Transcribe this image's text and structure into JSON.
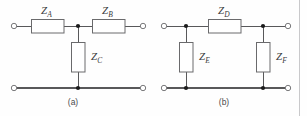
{
  "figure": {
    "colors": {
      "wire": "#58585a",
      "component_stroke": "#6a6a6c",
      "component_fill": "#ffffff",
      "node_dot": "#1b1b1b",
      "terminal": "#7a7a7c",
      "label_text": "#3a3a3c",
      "caption_text": "#4a4a4c",
      "page_rule": "#c9c9cb",
      "background": "#fefefe"
    },
    "circuits": [
      {
        "id": "circuit-a",
        "caption": "(a)",
        "topology": "T-network",
        "components": [
          {
            "id": "ZA",
            "symbol": "Z",
            "subscript": "A",
            "orientation": "horizontal",
            "position": "top-left-series"
          },
          {
            "id": "ZB",
            "symbol": "Z",
            "subscript": "B",
            "orientation": "horizontal",
            "position": "top-right-series"
          },
          {
            "id": "ZC",
            "symbol": "Z",
            "subscript": "C",
            "orientation": "vertical",
            "position": "center-shunt"
          }
        ],
        "terminals": [
          {
            "id": "a-in-top",
            "side": "left",
            "rail": "top"
          },
          {
            "id": "a-in-bottom",
            "side": "left",
            "rail": "bottom"
          },
          {
            "id": "a-out-top",
            "side": "right",
            "rail": "top"
          },
          {
            "id": "a-out-bottom",
            "side": "right",
            "rail": "bottom"
          }
        ],
        "nodes": [
          {
            "id": "a-node-top",
            "rail": "top"
          },
          {
            "id": "a-node-bottom",
            "rail": "bottom"
          }
        ]
      },
      {
        "id": "circuit-b",
        "caption": "(b)",
        "topology": "Pi-network",
        "components": [
          {
            "id": "ZD",
            "symbol": "Z",
            "subscript": "D",
            "orientation": "horizontal",
            "position": "top-series"
          },
          {
            "id": "ZE",
            "symbol": "Z",
            "subscript": "E",
            "orientation": "vertical",
            "position": "left-shunt"
          },
          {
            "id": "ZF",
            "symbol": "Z",
            "subscript": "F",
            "orientation": "vertical",
            "position": "right-shunt"
          }
        ],
        "terminals": [
          {
            "id": "b-in-top",
            "side": "left",
            "rail": "top"
          },
          {
            "id": "b-in-bottom",
            "side": "left",
            "rail": "bottom"
          },
          {
            "id": "b-out-top",
            "side": "right",
            "rail": "top"
          },
          {
            "id": "b-out-bottom",
            "side": "right",
            "rail": "bottom"
          }
        ],
        "nodes": [
          {
            "id": "b-node-top-left",
            "rail": "top"
          },
          {
            "id": "b-node-top-right",
            "rail": "top"
          },
          {
            "id": "b-node-bottom-left",
            "rail": "bottom"
          },
          {
            "id": "b-node-bottom-right",
            "rail": "bottom"
          }
        ]
      }
    ]
  }
}
